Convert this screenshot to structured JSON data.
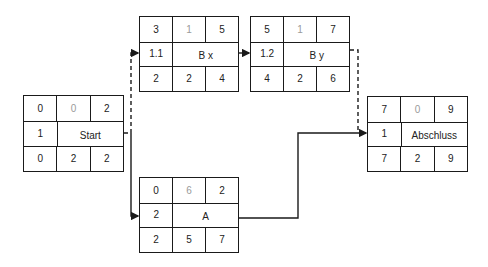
{
  "diagram": {
    "type": "network-plan",
    "colors": {
      "line": "#1a1a1a",
      "muted_text": "#9a9a9a"
    },
    "nodes": {
      "start": {
        "label": "Start",
        "top": [
          "0",
          "0",
          "2"
        ],
        "id": "1",
        "bottom": [
          "0",
          "2",
          "2"
        ]
      },
      "bx": {
        "label": "B x",
        "top": [
          "3",
          "1",
          "5"
        ],
        "id": "1.1",
        "bottom": [
          "2",
          "2",
          "4"
        ]
      },
      "by": {
        "label": "B y",
        "top": [
          "5",
          "1",
          "7"
        ],
        "id": "1.2",
        "bottom": [
          "4",
          "2",
          "6"
        ]
      },
      "a": {
        "label": "A",
        "top": [
          "0",
          "6",
          "2"
        ],
        "id": "2",
        "bottom": [
          "2",
          "5",
          "7"
        ]
      },
      "abschluss": {
        "label": "Abschluss",
        "top": [
          "7",
          "0",
          "9"
        ],
        "id": "1",
        "bottom": [
          "7",
          "2",
          "9"
        ]
      }
    },
    "edges": [
      {
        "from": "start",
        "to": "bx",
        "style": "dashed"
      },
      {
        "from": "start",
        "to": "a",
        "style": "solid"
      },
      {
        "from": "bx",
        "to": "by",
        "style": "solid"
      },
      {
        "from": "by",
        "to": "abschluss",
        "style": "dashed"
      },
      {
        "from": "a",
        "to": "abschluss",
        "style": "solid"
      }
    ]
  }
}
